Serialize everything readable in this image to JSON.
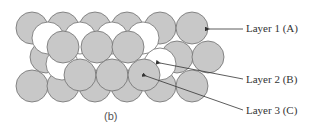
{
  "figure": {
    "caption": "(b)",
    "labels": {
      "layer1": "Layer 1 (A)",
      "layer2": "Layer 2 (B)",
      "layer3": "Layer 3 (C)"
    },
    "colors": {
      "gray_sphere": "#c8c8c8",
      "white_sphere": "#ffffff",
      "outline": "#6e6e6e",
      "arrow": "#333333"
    },
    "layers": {
      "A": {
        "fill": "gray",
        "rows": [
          {
            "y": 28,
            "x": [
              32,
              63,
              95,
              127,
              160,
              192
            ]
          },
          {
            "y": 57,
            "x": [
              46,
              177,
              208
            ]
          },
          {
            "y": 86,
            "x": [
              32,
              63,
              95,
              127,
              160,
              192
            ]
          }
        ]
      },
      "B": {
        "fill": "white",
        "spheres": [
          [
            48,
            38
          ],
          [
            80,
            38
          ],
          [
            112,
            38
          ],
          [
            143,
            38
          ],
          [
            62,
            64
          ],
          [
            160,
            64
          ]
        ]
      },
      "C": {
        "fill": "gray",
        "spheres": [
          [
            63,
            47
          ],
          [
            97,
            47
          ],
          [
            128,
            47
          ],
          [
            80,
            75
          ],
          [
            112,
            75
          ],
          [
            144,
            75
          ]
        ]
      }
    }
  }
}
